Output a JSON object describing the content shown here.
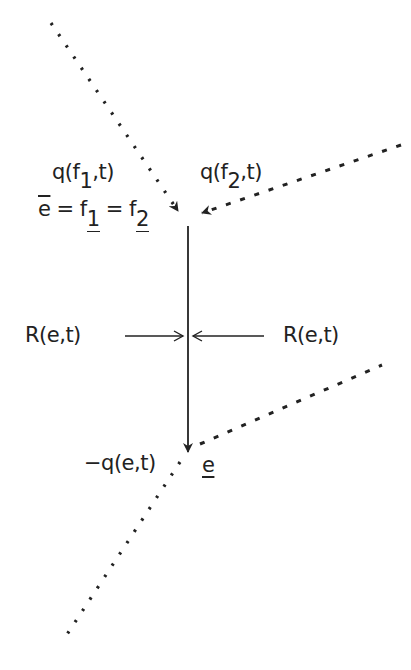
{
  "diagram": {
    "type": "edge-flux diagram",
    "colors": {
      "line": "#222222",
      "background": "#ffffff"
    },
    "labels": {
      "q_f1": {
        "prefix": "q(f",
        "sub": "1",
        "suffix": ",t)"
      },
      "q_f2": {
        "prefix": "q(f",
        "sub": "2",
        "suffix": ",t)"
      },
      "equality": {
        "ebar": "e",
        "eq1": " = f",
        "sub1": "1",
        "eq2": " = f",
        "sub2": "2"
      },
      "r_left": "R(e,t)",
      "r_right": "R(e,t)",
      "neg_q": "−q(e,t)",
      "e_under": "e"
    },
    "edges": [
      {
        "name": "incoming-f1",
        "style": "dotted",
        "from": [
          51,
          23
        ],
        "to": [
          180,
          214
        ],
        "arrow": true
      },
      {
        "name": "incoming-f2",
        "style": "dashed",
        "from": [
          401,
          145
        ],
        "to": [
          200,
          214
        ],
        "arrow": true
      },
      {
        "name": "edge-e",
        "style": "solid",
        "from": [
          188,
          226
        ],
        "to": [
          188,
          452
        ],
        "arrow": true
      },
      {
        "name": "outgoing-right",
        "style": "dashed",
        "from": [
          200,
          444
        ],
        "to": [
          382,
          365
        ],
        "arrow": false
      },
      {
        "name": "outgoing-left",
        "style": "dotted",
        "from": [
          180,
          462
        ],
        "to": [
          62,
          642
        ],
        "arrow": false
      }
    ],
    "force_arrows": [
      {
        "name": "r-left-arrow",
        "from": [
          125,
          336
        ],
        "to": [
          182,
          336
        ]
      },
      {
        "name": "r-right-arrow",
        "from": [
          264,
          336
        ],
        "to": [
          194,
          336
        ]
      }
    ]
  }
}
